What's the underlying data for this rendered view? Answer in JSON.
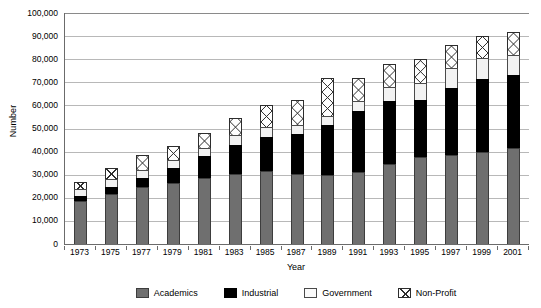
{
  "chart_data": {
    "type": "bar",
    "subtype": "stacked-bar",
    "title": "",
    "xlabel": "Year",
    "ylabel": "Number",
    "ylim": [
      0,
      100000
    ],
    "ytick_step": 10000,
    "grid": true,
    "legend_position": "bottom",
    "categories": [
      "1973",
      "1975",
      "1977",
      "1979",
      "1981",
      "1983",
      "1985",
      "1987",
      "1989",
      "1991",
      "1993",
      "1995",
      "1997",
      "1999",
      "2001"
    ],
    "ytick_labels": [
      "100,000",
      "90,000",
      "80,000",
      "70,000",
      "60,000",
      "50,000",
      "40,000",
      "30,000",
      "20,000",
      "10,000",
      "0"
    ],
    "legend_entries": [
      "Academics",
      "Industrial",
      "Government",
      "Non-Profit"
    ],
    "series": [
      {
        "name": "Academics",
        "color": "#6f6f6f",
        "pattern": "solid-gray",
        "values": [
          18500,
          21500,
          24500,
          26500,
          28500,
          30500,
          31500,
          30500,
          30000,
          31000,
          34500,
          37500,
          38500,
          40000,
          41500
        ]
      },
      {
        "name": "Industrial",
        "color": "#000000",
        "pattern": "solid-black",
        "values": [
          2500,
          3000,
          4000,
          6500,
          9500,
          12500,
          15000,
          17000,
          21500,
          26500,
          27500,
          25000,
          29000,
          31500,
          31500
        ]
      },
      {
        "name": "Government",
        "color": "#f2f2f2",
        "pattern": "white",
        "values": [
          3000,
          3500,
          3500,
          3500,
          3500,
          4000,
          4000,
          4000,
          4000,
          4500,
          6000,
          7000,
          8500,
          9000,
          9000
        ]
      },
      {
        "name": "Non-Profit",
        "color": "#ffffff",
        "pattern": "cross-hatch",
        "values": [
          3000,
          5000,
          6500,
          6000,
          6500,
          7500,
          9500,
          11000,
          16500,
          10000,
          10000,
          10500,
          10000,
          9500,
          10000
        ]
      }
    ],
    "totals": [
      27000,
      33000,
      38500,
      42500,
      48000,
      54500,
      60000,
      62500,
      72000,
      72000,
      78000,
      80000,
      86000,
      90000,
      92000
    ]
  },
  "axes": {
    "y_axis_title": "Number",
    "x_axis_title": "Year"
  }
}
